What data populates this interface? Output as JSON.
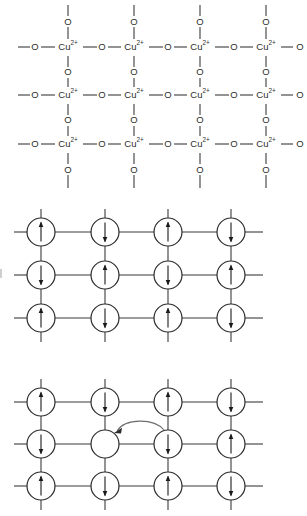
{
  "figure": {
    "background_color": "#ffffff",
    "line_color": "#3b3b3b",
    "circle_stroke_color": "#2b2b2b",
    "circle_fill_color": "#ffffff",
    "arrow_color": "#1a1a1a",
    "hop_arrow_color": "#6f6f6f",
    "panel_count": 3
  },
  "panels": [
    {
      "id": "panel-cuo2-plane",
      "name": "cuo2-plane-chemical-lattice",
      "type": "chemical-lattice",
      "rows": 3,
      "columns": 4,
      "copper_label": "Cu",
      "copper_charge": "2+",
      "oxygen_label": "O",
      "bond_symbol": "—",
      "grid": [
        [
          "Cu2+",
          "Cu2+",
          "Cu2+",
          "Cu2+"
        ],
        [
          "Cu2+",
          "Cu2+",
          "Cu2+",
          "Cu2+"
        ],
        [
          "Cu2+",
          "Cu2+",
          "Cu2+",
          "Cu2+"
        ]
      ],
      "bridging_atom": "O"
    },
    {
      "id": "panel-antiferromagnet",
      "name": "antiferromagnetic-spin-lattice",
      "type": "spin-lattice",
      "rows": 3,
      "columns": 4,
      "spins": [
        [
          "up",
          "down",
          "up",
          "down"
        ],
        [
          "down",
          "up",
          "down",
          "up"
        ],
        [
          "up",
          "down",
          "up",
          "down"
        ]
      ],
      "has_hole": false
    },
    {
      "id": "panel-hole-hopping",
      "name": "hole-hopping-spin-lattice",
      "type": "spin-lattice",
      "rows": 3,
      "columns": 4,
      "spins": [
        [
          "up",
          "down",
          "up",
          "down"
        ],
        [
          "down",
          "hole",
          "down",
          "up"
        ],
        [
          "up",
          "down",
          "up",
          "down"
        ]
      ],
      "has_hole": true,
      "hole_position": {
        "row": 1,
        "column": 1
      },
      "hop_arrow": {
        "name": "hole-hopping-arrow",
        "from": {
          "row": 1,
          "column": 2
        },
        "to": {
          "row": 1,
          "column": 1
        },
        "direction": "right-to-left",
        "style": "curved"
      }
    }
  ],
  "chart_data": {
    "type": "diagram",
    "subplots": [
      {
        "name": "cuo2-plane",
        "description": "Square lattice of Cu2+ ions bridged by O atoms, 3 rows by 4 columns",
        "node_labels": [
          "Cu2+",
          "O"
        ],
        "rows": 3,
        "columns": 4
      },
      {
        "name": "antiferromagnetic-order",
        "description": "Neel antiferromagnetic order, alternating up and down spins on every site",
        "rows": 3,
        "columns": 4,
        "spin_matrix": [
          [
            "up",
            "down",
            "up",
            "down"
          ],
          [
            "down",
            "up",
            "down",
            "up"
          ],
          [
            "up",
            "down",
            "up",
            "down"
          ]
        ]
      },
      {
        "name": "hole-doped-lattice",
        "description": "Same lattice with one vacancy (hole) at row 2 column 2; curved arrow shows spin hopping from row 2 column 3 into the hole",
        "rows": 3,
        "columns": 4,
        "spin_matrix": [
          [
            "up",
            "down",
            "up",
            "down"
          ],
          [
            "down",
            "hole",
            "down",
            "up"
          ],
          [
            "up",
            "down",
            "up",
            "down"
          ]
        ],
        "hole_cell": [
          1,
          1
        ],
        "hop_from": [
          1,
          2
        ],
        "hop_to": [
          1,
          1
        ]
      }
    ],
    "legend": [],
    "grid": false
  }
}
